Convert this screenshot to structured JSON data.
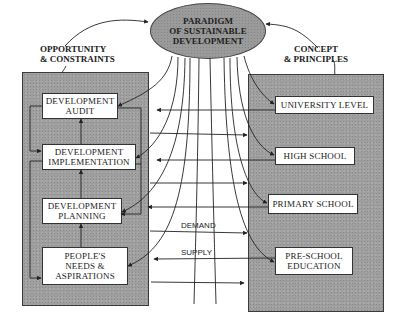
{
  "paradigm": {
    "lines": [
      "PARADIGM",
      "OF SUSTAINABLE",
      "DEVELOPMENT"
    ]
  },
  "left_heading": {
    "lines": [
      "OPPORTUNITY",
      "& CONSTRAINTS"
    ]
  },
  "right_heading": {
    "lines": [
      "CONCEPT",
      "& PRINCIPLES"
    ]
  },
  "left_boxes": [
    {
      "lines": [
        "DEVELOPMENT",
        "AUDIT"
      ]
    },
    {
      "lines": [
        "DEVELOPMENT",
        "IMPLEMENTATION"
      ]
    },
    {
      "lines": [
        "DEVELOPMENT",
        "PLANNING"
      ]
    },
    {
      "lines": [
        "PEOPLE'S",
        "NEEDS &",
        "ASPIRATIONS"
      ]
    }
  ],
  "right_boxes": [
    {
      "lines": [
        "UNIVERSITY LEVEL"
      ]
    },
    {
      "lines": [
        "HIGH SCHOOL"
      ]
    },
    {
      "lines": [
        "PRIMARY SCHOOL"
      ]
    },
    {
      "lines": [
        "PRE-SCHOOL",
        "EDUCATION"
      ]
    }
  ],
  "flow_labels": {
    "demand": "DEMAND",
    "supply": "SUPPLY"
  },
  "colors": {
    "panel": "#9e9e9e",
    "box": "#ffffff",
    "line": "#222222"
  }
}
